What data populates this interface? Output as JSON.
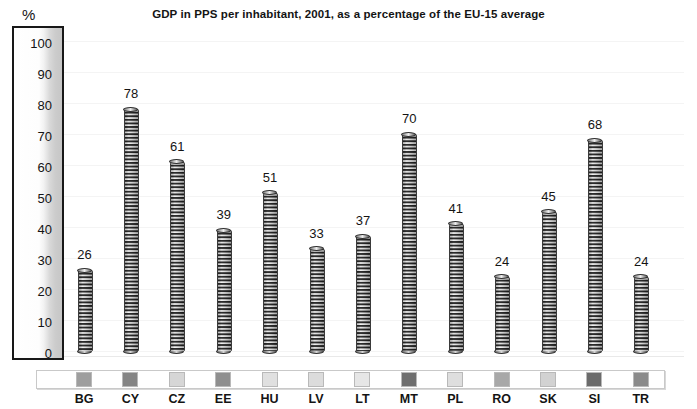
{
  "chart_data": {
    "type": "bar",
    "title": "GDP in PPS per inhabitant, 2001, as a percentage of the EU-15 average",
    "xlabel": "",
    "ylabel": "%",
    "ylim": [
      0,
      100
    ],
    "ytick_step": 10,
    "yticks": [
      "100",
      "90",
      "80",
      "70",
      "60",
      "50",
      "40",
      "30",
      "20",
      "10",
      "0"
    ],
    "grid": true,
    "legend_position": "bottom",
    "categories": [
      "BG",
      "CY",
      "CZ",
      "EE",
      "HU",
      "LV",
      "LT",
      "MT",
      "PL",
      "RO",
      "SK",
      "SI",
      "TR"
    ],
    "values": [
      26,
      78,
      61,
      39,
      51,
      33,
      37,
      70,
      41,
      24,
      45,
      68,
      24
    ],
    "series": [
      {
        "name": "GDP in PPS per inhabitant, 2001 (EU-15 = 100)",
        "values": [
          26,
          78,
          61,
          39,
          51,
          33,
          37,
          70,
          41,
          24,
          45,
          68,
          24
        ]
      }
    ],
    "swatch_colors": [
      "#9e9e9e",
      "#858585",
      "#d6d6d6",
      "#8f8f8f",
      "#e0e0e0",
      "#dcdcdc",
      "#e6e6e6",
      "#6f6f6f",
      "#dedede",
      "#a8a8a8",
      "#d2d2d2",
      "#6b6b6b",
      "#8b8b8b"
    ]
  },
  "colors": {
    "axis_border": "#181818",
    "text": "#141414",
    "gridline": "#f4f4f4",
    "legend_border": "#c9c9c9",
    "bar_dark": "#4a4a4a",
    "bar_light": "#e6e6e6",
    "background": "#ffffff"
  }
}
